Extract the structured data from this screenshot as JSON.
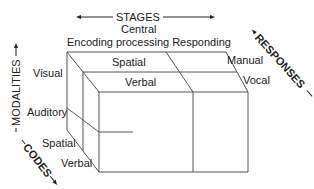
{
  "diagram": {
    "axes": {
      "stages": {
        "label": "STAGES",
        "levels": [
          "Encoding",
          "Central processing",
          "Responding"
        ],
        "header_line1": "Central",
        "header_line2": "Encoding processing Responding"
      },
      "responses": {
        "label": "RESPONSES",
        "levels": [
          "Manual",
          "Vocal"
        ]
      },
      "modalities": {
        "label": "MODALITIES",
        "levels": [
          "Visual",
          "Auditory"
        ]
      },
      "codes": {
        "label": "CODES",
        "levels": [
          "Spatial",
          "Verbal"
        ]
      }
    },
    "top_face_labels": [
      "Spatial",
      "Verbal"
    ],
    "colors": {
      "line": "#555555",
      "text": "#222222",
      "background": "#ffffff"
    }
  }
}
